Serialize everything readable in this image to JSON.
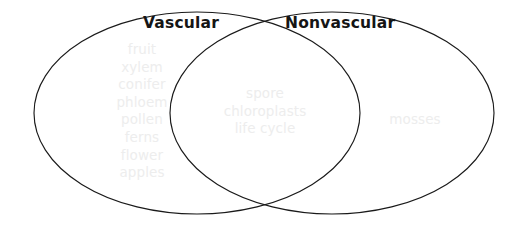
{
  "diagram": {
    "type": "venn-2-set",
    "background_color": "#ffffff",
    "outline_color": "#1a1a1a",
    "word_color": "#ededed",
    "title_color": "#151515",
    "left_set": {
      "title": "Vascular",
      "only_items": [
        "fruit",
        "xylem",
        "conifer",
        "phloem",
        "pollen",
        "ferns",
        "flower",
        "apples"
      ]
    },
    "right_set": {
      "title": "Nonvascular",
      "only_items": [
        "mosses"
      ]
    },
    "intersection": {
      "items": [
        "spore",
        "chloroplasts",
        "life cycle"
      ]
    }
  }
}
